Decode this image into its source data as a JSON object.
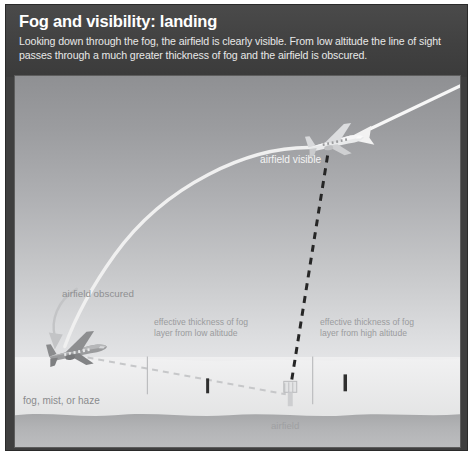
{
  "header": {
    "title": "Fog and visibility: landing",
    "subtitle": "Looking down through the fog, the airfield is clearly visible. From low altitude the line of sight passes through a much greater thickness of fog and the airfield is obscured."
  },
  "scene": {
    "labels": {
      "airfield_visible": "airfield visible",
      "airfield_obscured": "airfield obscured",
      "fog_layer": "fog, mist, or haze",
      "airfield": "airfield"
    },
    "callouts": {
      "low_altitude": "effective thickness of fog\nlayer from low altitude",
      "low_altitude_line1": "effective thickness of fog",
      "low_altitude_line2": "layer from low altitude",
      "high_altitude_line1": "effective thickness of fog",
      "high_altitude_line2": "layer from high altitude"
    },
    "icons": {
      "high_aircraft": "airplane-icon",
      "low_aircraft": "airplane-icon",
      "control_tower": "control-tower-icon",
      "approach_arrow": "arrow-left-icon",
      "obscured_arrow": "curved-arrow-down-icon",
      "runway_marker_left": "runway-marker-icon",
      "runway_marker_right": "runway-marker-icon"
    },
    "colors": {
      "frame": "#3f3f3f",
      "header_band": "#434343",
      "sky_top": "#8f9093",
      "sky_bottom": "#f3f3f4",
      "fog": "#e9e9ea",
      "ground": "#b3b4b6",
      "flight_path": "#f5f5f5",
      "sight_line_high": "#2d2d2d",
      "sight_line_low": "#c9cacc",
      "label_text": "#8b8c8e",
      "title_text": "#ffffff"
    }
  }
}
